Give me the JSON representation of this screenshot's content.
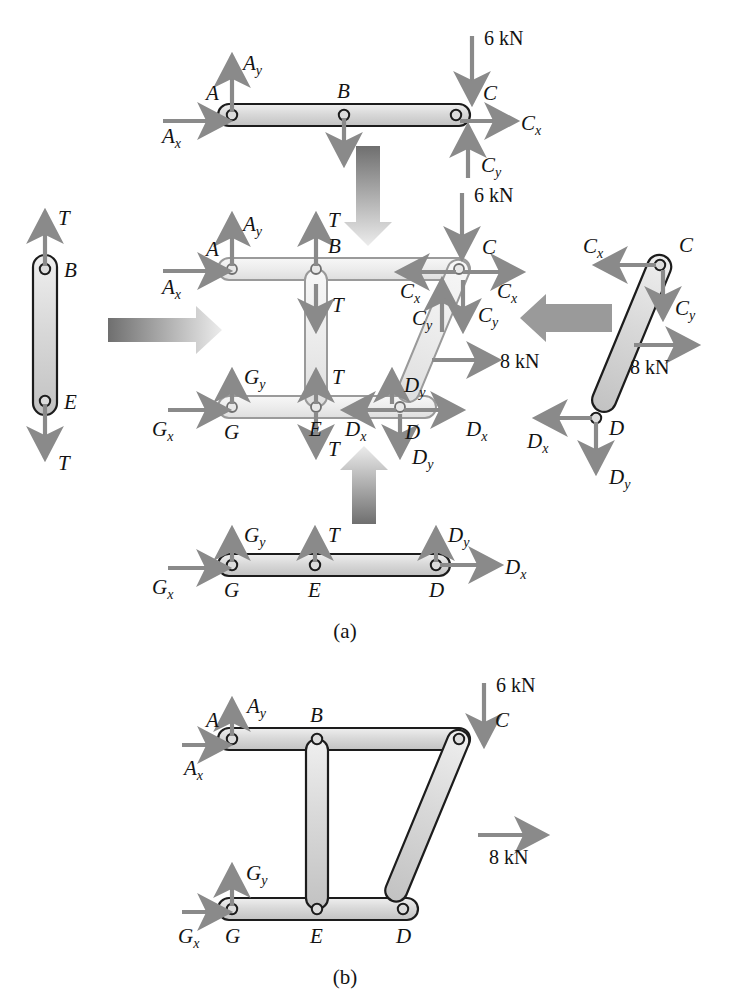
{
  "figure": {
    "type": "free-body-diagram",
    "parts": [
      {
        "id": "a",
        "label": "(a)",
        "caption_x": 330,
        "caption_y": 636
      },
      {
        "id": "b",
        "label": "(b)",
        "caption_x": 330,
        "caption_y": 984
      }
    ],
    "colors": {
      "member_fill": "#d6d6d6",
      "member_fill_light": "#e9e9e9",
      "member_stroke": "#1c1c1c",
      "force_arrow": "#8a8a8a",
      "transition_arrow_dark": "#6f6f6f",
      "transition_arrow_light": "#e3e3e3",
      "text": "#131313"
    }
  },
  "labels": {
    "A": "A",
    "B": "B",
    "C": "C",
    "D": "D",
    "E": "E",
    "G": "G",
    "T": "T",
    "Ax": "A",
    "Ax_sub": "x",
    "Ay": "A",
    "Ay_sub": "y",
    "Cx": "C",
    "Cx_sub": "x",
    "Cy": "C",
    "Cy_sub": "y",
    "Dx": "D",
    "Dx_sub": "x",
    "Dy": "D",
    "Dy_sub": "y",
    "Gx": "G",
    "Gx_sub": "x",
    "Gy": "G",
    "Gy_sub": "y",
    "load6": "6 kN",
    "load8": "8 kN"
  },
  "part_a": {
    "top_member": {
      "name": "member-AC-top",
      "joints": [
        "A",
        "B",
        "C"
      ],
      "forces": [
        {
          "name": "Ax",
          "dir": "right",
          "label": "A",
          "sub": "x"
        },
        {
          "name": "Ay",
          "dir": "up",
          "label": "A",
          "sub": "y"
        },
        {
          "name": "T",
          "dir": "down",
          "label": "T",
          "sub": ""
        },
        {
          "name": "load6",
          "dir": "down",
          "label": "6 kN",
          "sub": ""
        },
        {
          "name": "Cx",
          "dir": "right",
          "label": "C",
          "sub": "x"
        },
        {
          "name": "Cy",
          "dir": "up",
          "label": "C",
          "sub": "y"
        }
      ]
    },
    "left_member": {
      "name": "member-BE-link",
      "joints": [
        "B",
        "E"
      ],
      "forces": [
        {
          "name": "T_top",
          "dir": "up",
          "label": "T",
          "sub": ""
        },
        {
          "name": "T_bottom",
          "dir": "down",
          "label": "T",
          "sub": ""
        }
      ]
    },
    "right_member": {
      "name": "member-CD-link",
      "joints": [
        "C",
        "D"
      ],
      "forces": [
        {
          "name": "Cx",
          "dir": "left",
          "label": "C",
          "sub": "x"
        },
        {
          "name": "Cy",
          "dir": "down",
          "label": "C",
          "sub": "y"
        },
        {
          "name": "load8",
          "dir": "right",
          "label": "8 kN",
          "sub": ""
        },
        {
          "name": "Dx",
          "dir": "left",
          "label": "D",
          "sub": "x"
        },
        {
          "name": "Dy",
          "dir": "down",
          "label": "D",
          "sub": "y"
        }
      ]
    },
    "bottom_member": {
      "name": "member-GD-bottom",
      "joints": [
        "G",
        "E",
        "D"
      ],
      "forces": [
        {
          "name": "Gx",
          "dir": "right",
          "label": "G",
          "sub": "x"
        },
        {
          "name": "Gy",
          "dir": "up",
          "label": "G",
          "sub": "y"
        },
        {
          "name": "T",
          "dir": "up",
          "label": "T",
          "sub": ""
        },
        {
          "name": "Dy",
          "dir": "up",
          "label": "D",
          "sub": "y"
        },
        {
          "name": "Dx",
          "dir": "right",
          "label": "D",
          "sub": "x"
        }
      ]
    },
    "center_assembly": {
      "name": "center-exploded-assembly",
      "joints": [
        "A",
        "B",
        "C",
        "D",
        "E",
        "G"
      ],
      "forces": [
        {
          "name": "Ax",
          "dir": "right",
          "label": "A",
          "sub": "x"
        },
        {
          "name": "Ay",
          "dir": "up",
          "label": "A",
          "sub": "y"
        },
        {
          "name": "T_B_up",
          "dir": "up",
          "label": "T",
          "sub": ""
        },
        {
          "name": "T_B_down",
          "dir": "down",
          "label": "T",
          "sub": ""
        },
        {
          "name": "load6",
          "dir": "down",
          "label": "6 kN",
          "sub": ""
        },
        {
          "name": "Cx_left",
          "dir": "left",
          "label": "C",
          "sub": "x"
        },
        {
          "name": "Cx_right",
          "dir": "right",
          "label": "C",
          "sub": "x"
        },
        {
          "name": "Cy_up",
          "dir": "up",
          "label": "C",
          "sub": "y"
        },
        {
          "name": "Cy_down",
          "dir": "down",
          "label": "C",
          "sub": "y"
        },
        {
          "name": "load8",
          "dir": "right",
          "label": "8 kN",
          "sub": ""
        },
        {
          "name": "Gx",
          "dir": "right",
          "label": "G",
          "sub": "x"
        },
        {
          "name": "Gy",
          "dir": "up",
          "label": "G",
          "sub": "y"
        },
        {
          "name": "T_E_up",
          "dir": "up",
          "label": "T",
          "sub": ""
        },
        {
          "name": "T_E_down",
          "dir": "down",
          "label": "T",
          "sub": ""
        },
        {
          "name": "Dx_left",
          "dir": "left",
          "label": "D",
          "sub": "x"
        },
        {
          "name": "Dx_right",
          "dir": "right",
          "label": "D",
          "sub": "x"
        },
        {
          "name": "Dy_up",
          "dir": "up",
          "label": "D",
          "sub": "y"
        },
        {
          "name": "Dy_down",
          "dir": "down",
          "label": "D",
          "sub": "y"
        }
      ]
    },
    "transition_arrows": [
      {
        "name": "arrow-top-down",
        "dir": "down"
      },
      {
        "name": "arrow-left-right",
        "dir": "right"
      },
      {
        "name": "arrow-right-left",
        "dir": "left"
      },
      {
        "name": "arrow-bottom-up",
        "dir": "up"
      }
    ]
  },
  "part_b": {
    "name": "assembled-frame",
    "joints": [
      "A",
      "B",
      "C",
      "D",
      "E",
      "G"
    ],
    "forces": [
      {
        "name": "Ax",
        "dir": "right",
        "label": "A",
        "sub": "x"
      },
      {
        "name": "Ay",
        "dir": "up",
        "label": "A",
        "sub": "y"
      },
      {
        "name": "load6",
        "dir": "down",
        "label": "6 kN",
        "sub": ""
      },
      {
        "name": "load8",
        "dir": "right",
        "label": "8 kN",
        "sub": ""
      },
      {
        "name": "Gx",
        "dir": "right",
        "label": "G",
        "sub": "x"
      },
      {
        "name": "Gy",
        "dir": "up",
        "label": "G",
        "sub": "y"
      }
    ]
  }
}
